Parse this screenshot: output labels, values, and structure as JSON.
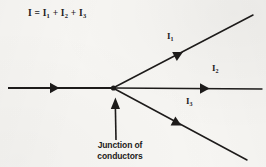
{
  "figure": {
    "kind": "physics-circuit-diagram",
    "background_color": "#f7f6f3",
    "ink_color": "#1d1b1a"
  },
  "equation": {
    "full_text": "I = I1 + I2 + I3",
    "lhs": "I",
    "relation": "=",
    "terms": [
      "I1",
      "I2",
      "I3"
    ],
    "parts": {
      "i": "I",
      "eq": "=",
      "i1_base": "I",
      "i1_sub": "1",
      "plus1": "+",
      "i2_base": "I",
      "i2_sub": "2",
      "plus2": "+",
      "i3_base": "I",
      "i3_sub": "3"
    }
  },
  "junction": {
    "x": 113,
    "y": 88,
    "caption_line1": "Junction of",
    "caption_line2": "conductors",
    "pointer": {
      "from_x": 116,
      "from_y": 140,
      "to_x": 115,
      "to_y": 97
    }
  },
  "conductors": [
    {
      "id": "incoming-current",
      "label_base": "I",
      "label_sub": "",
      "label_text": "I",
      "direction": "into-junction",
      "from_x": 8,
      "from_y": 88,
      "to_x": 113,
      "to_y": 88,
      "arrow_x": 57,
      "arrow_y": 88,
      "arrow_angle_deg": 0
    },
    {
      "id": "branch-1",
      "label_base": "I",
      "label_sub": "1",
      "label_text": "I1",
      "direction": "out-of-junction",
      "from_x": 113,
      "from_y": 88,
      "to_x": 253,
      "to_y": 15,
      "arrow_x": 180,
      "arrow_y": 53,
      "arrow_angle_deg": -27.5
    },
    {
      "id": "branch-2",
      "label_base": "I",
      "label_sub": "2",
      "label_text": "I2",
      "direction": "out-of-junction",
      "from_x": 113,
      "from_y": 88,
      "to_x": 262,
      "to_y": 89,
      "arrow_x": 206,
      "arrow_y": 88,
      "arrow_angle_deg": 0
    },
    {
      "id": "branch-3",
      "label_base": "I",
      "label_sub": "3",
      "label_text": "I3",
      "direction": "out-of-junction",
      "from_x": 113,
      "from_y": 88,
      "to_x": 247,
      "to_y": 160,
      "arrow_x": 179,
      "arrow_y": 124,
      "arrow_angle_deg": 28.5
    }
  ]
}
